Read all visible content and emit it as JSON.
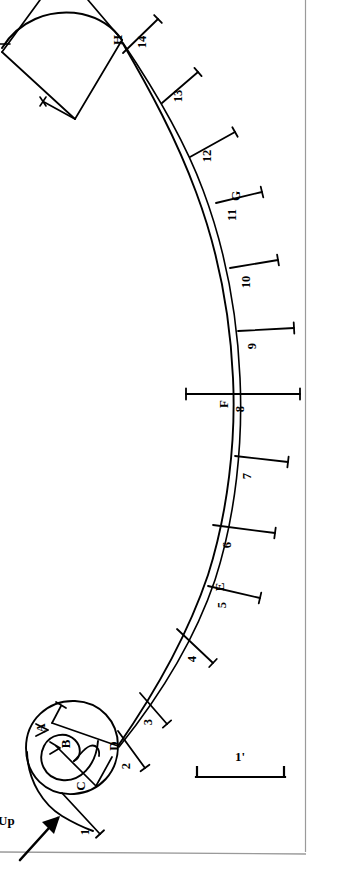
{
  "drawing": {
    "title": "Profile drawing with radial measurement rays",
    "ink_color": "#000000",
    "paper_color": "#ffffff",
    "border_color": "#9a9a9a"
  },
  "orientation": {
    "label": "Up",
    "arrow_name": "up-arrow"
  },
  "scale_bar": {
    "label": "1'",
    "length_px": 89
  },
  "rays": [
    {
      "id": "1",
      "label": "1",
      "x1": 62,
      "y1": 793,
      "x2": 100,
      "y2": 834,
      "tick": "end",
      "lx": 89,
      "ly": 832,
      "rot": -90
    },
    {
      "id": "2",
      "label": "2",
      "x1": 118,
      "y1": 731,
      "x2": 145,
      "y2": 768,
      "tick": "end",
      "lx": 130,
      "ly": 766,
      "rot": -90
    },
    {
      "id": "3",
      "label": "3",
      "x1": 140,
      "y1": 693,
      "x2": 167,
      "y2": 724,
      "tick": "end",
      "lx": 152,
      "ly": 722,
      "rot": -90
    },
    {
      "id": "4",
      "label": "4",
      "x1": 177,
      "y1": 629,
      "x2": 213,
      "y2": 663,
      "tick": "end",
      "lx": 196,
      "ly": 659,
      "rot": -90
    },
    {
      "id": "5",
      "label": "5",
      "x1": 208,
      "y1": 586,
      "x2": 260,
      "y2": 598,
      "tick": "end",
      "lx": 226,
      "ly": 605,
      "rot": -90
    },
    {
      "id": "6",
      "label": "6",
      "x1": 213,
      "y1": 525,
      "x2": 275,
      "y2": 533,
      "tick": "end",
      "lx": 231,
      "ly": 545,
      "rot": -90
    },
    {
      "id": "7",
      "label": "7",
      "x1": 235,
      "y1": 456,
      "x2": 288,
      "y2": 462,
      "tick": "end",
      "lx": 251,
      "ly": 476,
      "rot": -90
    },
    {
      "id": "8",
      "label": "8",
      "x1": 186,
      "y1": 394,
      "x2": 300,
      "y2": 394,
      "tick": "both",
      "lx": 244,
      "ly": 409,
      "rot": -90
    },
    {
      "id": "9",
      "label": "9",
      "x1": 238,
      "y1": 331,
      "x2": 294,
      "y2": 328,
      "tick": "end",
      "lx": 256,
      "ly": 346,
      "rot": -90
    },
    {
      "id": "10",
      "label": "10",
      "x1": 230,
      "y1": 268,
      "x2": 278,
      "y2": 260,
      "tick": "end",
      "lx": 250,
      "ly": 282,
      "rot": -90
    },
    {
      "id": "11",
      "label": "11",
      "x1": 216,
      "y1": 203,
      "x2": 262,
      "y2": 192,
      "tick": "end",
      "lx": 236,
      "ly": 215,
      "rot": -90
    },
    {
      "id": "12",
      "label": "12",
      "x1": 190,
      "y1": 157,
      "x2": 235,
      "y2": 132,
      "tick": "end",
      "lx": 211,
      "ly": 156,
      "rot": -90
    },
    {
      "id": "13",
      "label": "13",
      "x1": 162,
      "y1": 103,
      "x2": 198,
      "y2": 72,
      "tick": "end",
      "lx": 182,
      "ly": 96,
      "rot": -90
    },
    {
      "id": "14",
      "label": "14",
      "x1": 123,
      "y1": 53,
      "x2": 158,
      "y2": 19,
      "tick": "end",
      "lx": 146,
      "ly": 42,
      "rot": -90
    }
  ],
  "points": [
    {
      "id": "A",
      "label": "A",
      "x": 45,
      "y": 728
    },
    {
      "id": "B",
      "label": "B",
      "x": 70,
      "y": 744
    },
    {
      "id": "C",
      "label": "C",
      "x": 85,
      "y": 786
    },
    {
      "id": "D",
      "label": "D",
      "x": 118,
      "y": 746
    },
    {
      "id": "E",
      "label": "E",
      "x": 224,
      "y": 587
    },
    {
      "id": "F",
      "label": "F",
      "x": 228,
      "y": 404
    },
    {
      "id": "G",
      "label": "G",
      "x": 240,
      "y": 196
    },
    {
      "id": "H",
      "label": "H",
      "x": 122,
      "y": 40
    }
  ]
}
